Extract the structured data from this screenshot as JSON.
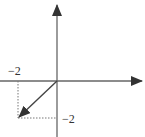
{
  "diagram": {
    "type": "vector-on-axes",
    "labels": {
      "x_component": "−2",
      "y_component": "−2"
    },
    "vector": {
      "from": [
        0,
        0
      ],
      "to": [
        -2,
        -2
      ]
    },
    "colors": {
      "axis": "#555555",
      "vector": "#444444",
      "guide": "#777777"
    }
  }
}
